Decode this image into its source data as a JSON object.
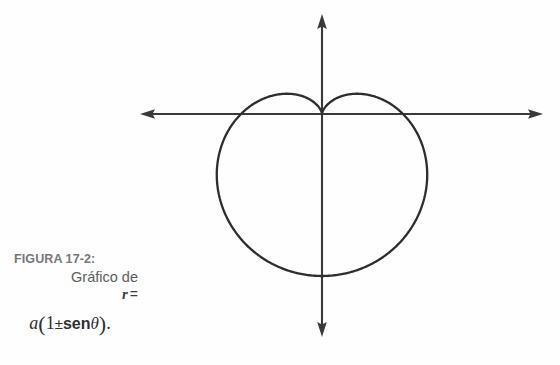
{
  "figure": {
    "caption_title": "FIGURA 17-2:",
    "caption_line1": "Gráfico de",
    "caption_line2_variable": "r",
    "caption_line2_equals": "=",
    "formula": {
      "coefficient": "a",
      "open_paren": "(",
      "one": "1",
      "plus_minus": "±",
      "function": "sen",
      "angle": "θ",
      "close_paren": ")",
      "period": "."
    },
    "formula_plain": "a(1±senθ)."
  },
  "colors": {
    "background": "#fefefe",
    "axis": "#3a3a3c",
    "curve": "#2e2e30",
    "caption_title": "#77777a",
    "caption_text": "#5d5d60",
    "formula_text": "#2f2f31"
  },
  "chart_data": {
    "type": "line",
    "title": "",
    "xlabel": "",
    "ylabel": "",
    "curve_name": "cardioid",
    "polar_equation": "r = a(1 ± sen θ)",
    "orientation": "cusp-up",
    "grid": false,
    "legend": null,
    "axes": {
      "origin_px": [
        322,
        114
      ],
      "horizontal_axis": {
        "from_px": [
          140,
          114
        ],
        "to_px": [
          543,
          114
        ],
        "arrows": "both"
      },
      "vertical_axis": {
        "from_px": [
          322,
          14
        ],
        "to_px": [
          322,
          337
        ],
        "arrows": "both"
      }
    },
    "curve_extremes_px": {
      "cusp": [
        322,
        114
      ],
      "leftmost": [
        220,
        180
      ],
      "rightmost": [
        422,
        180
      ],
      "bottom": [
        322,
        277
      ],
      "left_lobe_peak": [
        278,
        95
      ],
      "right_lobe_peak": [
        366,
        95
      ]
    },
    "parametric": {
      "a_px": 81,
      "x_of_t": "cx + a*(1 - sin t)*cos t",
      "y_of_t": "cy - a*(1 - sin t)*sin t",
      "t_range_deg": [
        0,
        360
      ]
    }
  }
}
